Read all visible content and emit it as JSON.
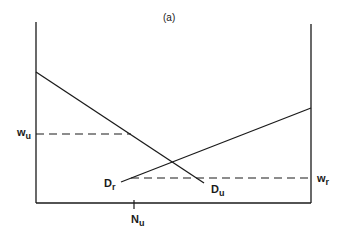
{
  "diagram": {
    "title": "(a)",
    "labels": {
      "wu": {
        "base": "w",
        "sub": "u"
      },
      "wr": {
        "base": "w",
        "sub": "r"
      },
      "Du": {
        "base": "D",
        "sub": "u"
      },
      "Dr": {
        "base": "D",
        "sub": "r"
      },
      "Nu": {
        "base": "N",
        "sub": "u"
      }
    },
    "lines": [
      {
        "name": "left-axis",
        "style": "solid"
      },
      {
        "name": "right-axis",
        "style": "solid"
      },
      {
        "name": "bottom-axis",
        "style": "solid"
      },
      {
        "name": "demand-curve-Du",
        "style": "solid",
        "label": "Du"
      },
      {
        "name": "demand-curve-Dr",
        "style": "solid",
        "label": "Dr"
      },
      {
        "name": "wage-wu",
        "style": "dashed",
        "label": "wu"
      },
      {
        "name": "wage-wr",
        "style": "dashed",
        "label": "wr"
      }
    ],
    "colors": {
      "ink": "#1a1a1a",
      "background": "#ffffff"
    }
  }
}
